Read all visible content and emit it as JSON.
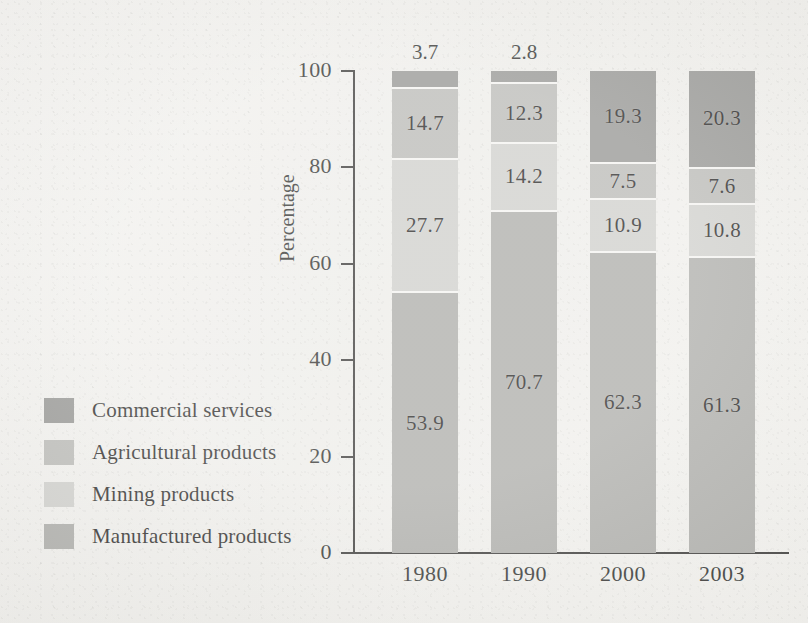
{
  "chart_data": {
    "type": "bar",
    "subtype": "stacked-bar-100",
    "title": "",
    "xlabel": "",
    "ylabel": "Percentage",
    "ylim": [
      0,
      100
    ],
    "yticks": [
      0,
      20,
      40,
      60,
      80,
      100
    ],
    "ytick_labels": [
      "0",
      "20",
      "40",
      "60",
      "80",
      "100"
    ],
    "grid": false,
    "legend_position": "left",
    "categories": [
      "1980",
      "1990",
      "2000",
      "2003"
    ],
    "series": [
      {
        "name": "Commercial services",
        "color": "#8d8d8a",
        "values": [
          3.7,
          2.8,
          19.3,
          20.3
        ],
        "labels": [
          "3.7",
          "2.8",
          "19.3",
          "20.3"
        ],
        "label_placement": [
          "outside",
          "outside",
          "inside",
          "inside"
        ]
      },
      {
        "name": "Agricultural products",
        "color": "#b4b4b0",
        "values": [
          14.7,
          12.3,
          7.5,
          7.6
        ],
        "labels": [
          "14.7",
          "12.3",
          "7.5",
          "7.6"
        ],
        "label_placement": [
          "inside",
          "inside",
          "inside",
          "inside"
        ]
      },
      {
        "name": "Mining products",
        "color": "#cbcbc7",
        "values": [
          27.7,
          14.2,
          10.9,
          10.8
        ],
        "labels": [
          "27.7",
          "14.2",
          "10.9",
          "10.8"
        ],
        "label_placement": [
          "inside",
          "inside",
          "inside",
          "inside"
        ]
      },
      {
        "name": "Manufactured products",
        "color": "#a6a6a2",
        "values": [
          53.9,
          70.7,
          62.3,
          61.3
        ],
        "labels": [
          "53.9",
          "70.7",
          "62.3",
          "61.3"
        ],
        "label_placement": [
          "inside",
          "inside",
          "inside",
          "inside"
        ]
      }
    ]
  },
  "axis": {
    "y_title": "Percentage",
    "y_labels": [
      "100",
      "80",
      "60",
      "40",
      "20",
      "0"
    ],
    "x_labels": [
      "1980",
      "1990",
      "2000",
      "2003"
    ]
  },
  "legend": {
    "items": [
      {
        "label": "Commercial services",
        "color": "#8d8d8a"
      },
      {
        "label": "Agricultural products",
        "color": "#b4b4b0"
      },
      {
        "label": "Mining products",
        "color": "#cbcbc7"
      },
      {
        "label": "Manufactured products",
        "color": "#a6a6a2"
      }
    ]
  },
  "bar_outside_labels": {
    "b0": "3.7",
    "b1": "2.8"
  },
  "bars": [
    {
      "year": "1980",
      "segments": [
        {
          "name": "Commercial services",
          "value": 3.7,
          "label": "3.7",
          "color": "#8d8d8a",
          "show_inside": false
        },
        {
          "name": "Agricultural products",
          "value": 14.7,
          "label": "14.7",
          "color": "#b4b4b0",
          "show_inside": true
        },
        {
          "name": "Mining products",
          "value": 27.7,
          "label": "27.7",
          "color": "#cbcbc7",
          "show_inside": true
        },
        {
          "name": "Manufactured products",
          "value": 53.9,
          "label": "53.9",
          "color": "#a6a6a2",
          "show_inside": true
        }
      ]
    },
    {
      "year": "1990",
      "segments": [
        {
          "name": "Commercial services",
          "value": 2.8,
          "label": "2.8",
          "color": "#8d8d8a",
          "show_inside": false
        },
        {
          "name": "Agricultural products",
          "value": 12.3,
          "label": "12.3",
          "color": "#b4b4b0",
          "show_inside": true
        },
        {
          "name": "Mining products",
          "value": 14.2,
          "label": "14.2",
          "color": "#cbcbc7",
          "show_inside": true
        },
        {
          "name": "Manufactured products",
          "value": 70.7,
          "label": "70.7",
          "color": "#a6a6a2",
          "show_inside": true
        }
      ]
    },
    {
      "year": "2000",
      "segments": [
        {
          "name": "Commercial services",
          "value": 19.3,
          "label": "19.3",
          "color": "#8d8d8a",
          "show_inside": true
        },
        {
          "name": "Agricultural products",
          "value": 7.5,
          "label": "7.5",
          "color": "#b4b4b0",
          "show_inside": true
        },
        {
          "name": "Mining products",
          "value": 10.9,
          "label": "10.9",
          "color": "#cbcbc7",
          "show_inside": true
        },
        {
          "name": "Manufactured products",
          "value": 62.3,
          "label": "62.3",
          "color": "#a6a6a2",
          "show_inside": true
        }
      ]
    },
    {
      "year": "2003",
      "segments": [
        {
          "name": "Commercial services",
          "value": 20.3,
          "label": "20.3",
          "color": "#8d8d8a",
          "show_inside": true
        },
        {
          "name": "Agricultural products",
          "value": 7.6,
          "label": "7.6",
          "color": "#b4b4b0",
          "show_inside": true
        },
        {
          "name": "Mining products",
          "value": 10.8,
          "label": "10.8",
          "color": "#cbcbc7",
          "show_inside": true
        },
        {
          "name": "Manufactured products",
          "value": 61.3,
          "label": "61.3",
          "color": "#a6a6a2",
          "show_inside": true
        }
      ]
    }
  ]
}
